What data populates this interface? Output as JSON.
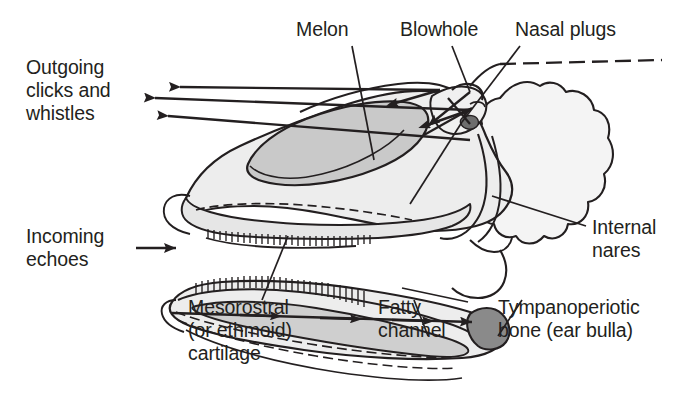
{
  "figure": {
    "background_color": "#ffffff",
    "line_color": "#231f20"
  },
  "labels": {
    "outgoing": "Outgoing\nclicks and\nwhistles",
    "incoming": "Incoming\nechoes",
    "melon": "Melon",
    "blowhole": "Blowhole",
    "nasal_plugs": "Nasal plugs",
    "internal_nares": "Internal\nnares",
    "mesorostral": "Mesorostral\n(or ethmoid)\ncartilage",
    "fatty_channel": "Fatty\nchannel",
    "tympanoperiotic": "Tympanoperiotic\nbone (ear bulla)"
  },
  "colors": {
    "skull_fill": "#eeeeee",
    "melon_fill": "#c8c8c8",
    "fatty_channel_fill": "#cfcfcf",
    "ear_bulla_fill": "#8a8a8a",
    "outline": "#231f20",
    "text": "#231f20"
  },
  "arrows": {
    "outgoing_count": 3,
    "outgoing_direction": "left",
    "incoming_direction": "right",
    "incoming_count": 1,
    "channel_arrowheads": 4
  }
}
